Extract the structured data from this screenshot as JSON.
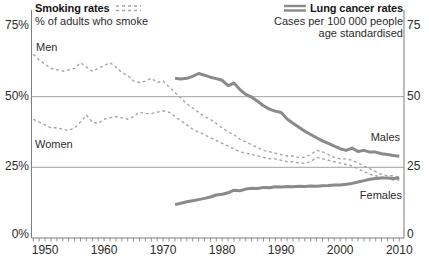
{
  "chart_data": {
    "type": "line",
    "legend_smoking": {
      "title": "Smoking rates",
      "subtitle": "% of adults who smoke"
    },
    "legend_cancer": {
      "title": "Lung cancer rates",
      "subtitle1": "Cases per 100 000 people",
      "subtitle2": "age standardised"
    },
    "x_axis": {
      "range": [
        1948,
        2010
      ],
      "decade_ticks": [
        1950,
        1960,
        1970,
        1980,
        1990,
        2000,
        2010
      ],
      "minor_tick_every_years": 1
    },
    "y_left": {
      "labels": [
        "75%",
        "50%",
        "25%",
        "0%"
      ],
      "values": [
        75,
        50,
        25,
        0
      ]
    },
    "y_right": {
      "labels": [
        "75",
        "50",
        "25",
        "0"
      ],
      "values": [
        75,
        50,
        25,
        0
      ]
    },
    "gridline_values": [
      50,
      25
    ],
    "colors": {
      "smoking_dashed": "#a5a5a5",
      "cancer_solid": "#8a8a8a",
      "grid": "#a2a2a2",
      "axis": "#7d7d7d",
      "tick": "#949494",
      "text": "#2b2b2b"
    },
    "series": [
      {
        "name": "Men",
        "group": "smoking-rates",
        "line_style": "dashed",
        "start_year": 1948,
        "values": [
          65,
          63,
          61.5,
          60,
          59.5,
          59,
          59.5,
          60,
          62,
          60.5,
          59,
          60,
          61,
          62,
          60.5,
          58.5,
          57.5,
          55.5,
          55,
          55.5,
          56.5,
          55,
          55.5,
          53.5,
          51.5,
          49.5,
          47.5,
          46,
          44.5,
          43,
          42,
          40.5,
          39,
          37.5,
          36.5,
          35,
          34,
          33,
          32,
          31,
          30.5,
          30,
          29.5,
          29,
          29,
          28.5,
          28.5,
          29.5,
          31,
          30.5,
          29.5,
          28.5,
          28,
          28,
          27.5,
          26.5,
          25.5,
          24.5,
          23.5,
          22.5,
          22,
          22,
          21.5
        ]
      },
      {
        "name": "Women",
        "group": "smoking-rates",
        "line_style": "dashed",
        "start_year": 1948,
        "values": [
          42,
          41,
          40,
          39,
          39,
          38.5,
          38,
          39,
          41,
          43.5,
          41,
          40.5,
          42,
          42.5,
          43,
          42.5,
          42,
          43,
          44.5,
          44,
          44,
          44.5,
          45,
          44.5,
          43,
          41.5,
          40,
          38.5,
          37.5,
          36.5,
          35.5,
          34.5,
          33.5,
          32.5,
          31.5,
          30.5,
          30,
          29.5,
          29,
          28.5,
          28,
          28,
          27.5,
          27,
          27,
          26.5,
          26.5,
          27,
          28.5,
          28,
          27.5,
          27,
          26.5,
          26,
          25.5,
          24.5,
          23.5,
          22.5,
          22,
          21.5,
          21,
          20.5,
          20.5
        ]
      },
      {
        "name": "Males",
        "group": "lung-cancer-rates",
        "line_style": "solid",
        "start_year": 1972,
        "values": [
          56.5,
          56.2,
          56.5,
          57.2,
          58.2,
          57.6,
          56.9,
          56.4,
          55.8,
          53.9,
          54.8,
          52.5,
          50.8,
          49.8,
          48.4,
          46.8,
          45.6,
          44.9,
          44.4,
          42.1,
          40.6,
          39.2,
          37.8,
          36.6,
          35.5,
          34.4,
          33.5,
          32.5,
          31.6,
          31,
          31.8,
          30.6,
          31,
          30.4,
          30.4,
          29.8,
          29.5,
          29.2,
          28.9
        ]
      },
      {
        "name": "Females",
        "group": "lung-cancer-rates",
        "line_style": "solid",
        "start_year": 1972,
        "values": [
          11.8,
          12.3,
          12.8,
          13.2,
          13.6,
          14,
          14.5,
          15.2,
          15.5,
          16,
          16.9,
          16.7,
          17.3,
          17.6,
          17.5,
          17.9,
          17.8,
          18.1,
          18,
          18.2,
          18.1,
          18.3,
          18.2,
          18.4,
          18.3,
          18.5,
          18.6,
          18.8,
          18.8,
          19,
          19.3,
          19.8,
          20.3,
          20.8,
          21,
          21.2,
          21.2,
          21,
          21.2
        ]
      }
    ]
  }
}
